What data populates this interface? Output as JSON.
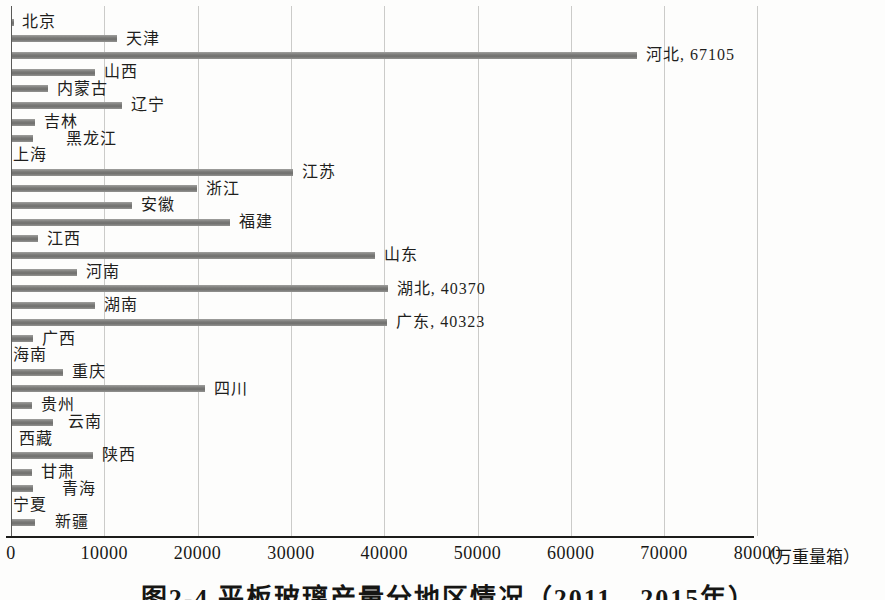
{
  "chart_data": {
    "type": "bar",
    "orientation": "horizontal",
    "caption": "图2-4 平板玻璃产量分地区情况（2011—2015年）",
    "caption_clipped_at_bottom": true,
    "unit_label": "（万重量箱）",
    "xlabel": "万重量箱",
    "xlim": [
      0,
      80000
    ],
    "x_ticks": [
      0,
      10000,
      20000,
      30000,
      40000,
      50000,
      60000,
      70000,
      80000
    ],
    "grid": "vertical",
    "legend": "none",
    "bar_color": "#7e7e7c",
    "gridline_color": "#cbcbc9",
    "categories": [
      "北京",
      "天津",
      "河北",
      "山西",
      "内蒙古",
      "辽宁",
      "吉林",
      "黑龙江",
      "上海",
      "江苏",
      "浙江",
      "安徽",
      "福建",
      "江西",
      "山东",
      "河南",
      "湖北",
      "湖南",
      "广东",
      "广西",
      "海南",
      "重庆",
      "四川",
      "贵州",
      "云南",
      "西藏",
      "陕西",
      "甘肃",
      "青海",
      "宁夏",
      "新疆"
    ],
    "values": [
      300,
      11400,
      67105,
      9000,
      4000,
      11900,
      2600,
      2400,
      150,
      30200,
      19900,
      13000,
      23500,
      2900,
      39000,
      7100,
      40370,
      9000,
      40323,
      2400,
      0,
      5600,
      20800,
      2300,
      4500,
      0,
      8800,
      2300,
      2400,
      0,
      2600
    ],
    "value_labels": {
      "河北": "67105",
      "湖北": "40370",
      "广东": "40323"
    },
    "label_x_overrides": {
      "北京": 22,
      "黑龙江": 66,
      "上海": 13,
      "海南": 13,
      "西藏": 19,
      "宁夏": 13,
      "云南": 68,
      "青海": 62,
      "新疆": 55
    }
  }
}
